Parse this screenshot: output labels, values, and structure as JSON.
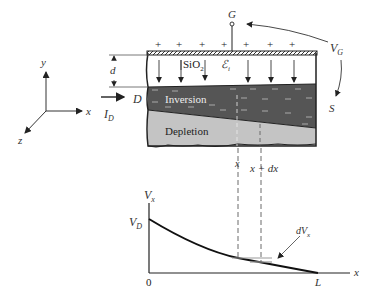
{
  "diagram": {
    "gate": {
      "label": "G"
    },
    "gate_voltage": {
      "label": "V",
      "sub": "G"
    },
    "source": {
      "label": "S"
    },
    "drain": {
      "label": "D"
    },
    "drain_current": {
      "label": "I",
      "sub": "D"
    },
    "oxide": {
      "label": "SiO",
      "sub": "2"
    },
    "field": {
      "label": "ℰ",
      "sub": "i"
    },
    "thickness": {
      "label": "d"
    },
    "inversion": {
      "label": "Inversion"
    },
    "depletion": {
      "label": "Depletion"
    },
    "plus_sign": "+",
    "axes": {
      "x": "x",
      "y": "y",
      "z": "z"
    },
    "slice": {
      "x_label": "x",
      "x_dx_label": "x  +  dx"
    }
  },
  "graph": {
    "y_label": {
      "label": "V",
      "sub": "x"
    },
    "vd_label": {
      "label": "V",
      "sub": "D"
    },
    "x_label": "x",
    "origin": "0",
    "end": "L",
    "dvx_label": {
      "label": "dV",
      "sub": "x"
    }
  },
  "colors": {
    "inversion": "#555555",
    "depletion": "#c4c4c4",
    "outline": "#222222"
  }
}
